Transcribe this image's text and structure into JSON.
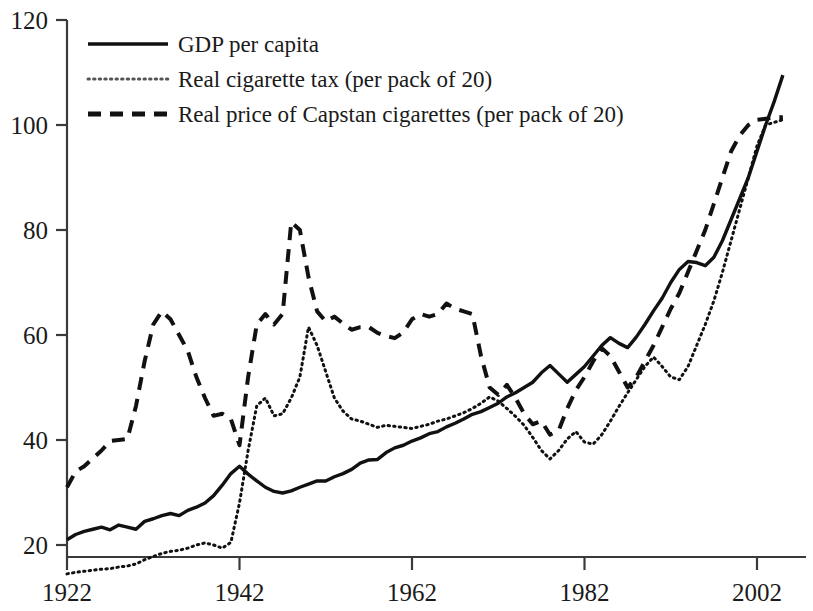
{
  "chart_data": {
    "type": "line",
    "title": "",
    "subtitle": "",
    "xlabel": "",
    "ylabel": "",
    "xlim": [
      1922,
      2006
    ],
    "ylim": [
      10,
      120
    ],
    "grid": false,
    "legend_position": "top-left",
    "x_ticks": [
      1922,
      1942,
      1962,
      1982,
      2002
    ],
    "x_tick_labels": [
      "1922",
      "1942",
      "1962",
      "1982",
      "2002"
    ],
    "y_ticks": [
      20,
      40,
      60,
      80,
      100,
      120
    ],
    "y_tick_labels": [
      "20",
      "40",
      "60",
      "80",
      "100",
      "120"
    ],
    "series": [
      {
        "name": "GDP per capita",
        "style": "solid",
        "color": "#111111",
        "x": [
          1922,
          1923,
          1924,
          1925,
          1926,
          1927,
          1928,
          1929,
          1930,
          1931,
          1932,
          1933,
          1934,
          1935,
          1936,
          1937,
          1938,
          1939,
          1940,
          1941,
          1942,
          1943,
          1944,
          1945,
          1946,
          1947,
          1948,
          1949,
          1950,
          1951,
          1952,
          1953,
          1954,
          1955,
          1956,
          1957,
          1958,
          1959,
          1960,
          1961,
          1962,
          1963,
          1964,
          1965,
          1966,
          1967,
          1968,
          1969,
          1970,
          1971,
          1972,
          1973,
          1974,
          1975,
          1976,
          1977,
          1978,
          1979,
          1980,
          1981,
          1982,
          1983,
          1984,
          1985,
          1986,
          1987,
          1988,
          1989,
          1990,
          1991,
          1992,
          1993,
          1994,
          1995,
          1996,
          1997,
          1998,
          1999,
          2000,
          2001,
          2002,
          2003,
          2004,
          2005
        ],
        "values": [
          21.0,
          22.0,
          22.6,
          23.0,
          23.4,
          22.9,
          23.8,
          23.4,
          23.0,
          24.5,
          25.0,
          25.6,
          26.0,
          25.6,
          26.6,
          27.2,
          28.0,
          29.4,
          31.4,
          33.6,
          35.0,
          33.5,
          32.2,
          31.0,
          30.2,
          29.9,
          30.3,
          31.0,
          31.6,
          32.2,
          32.2,
          33.0,
          33.6,
          34.4,
          35.6,
          36.2,
          36.3,
          37.6,
          38.5,
          39.0,
          39.8,
          40.4,
          41.2,
          41.6,
          42.5,
          43.2,
          44.0,
          44.9,
          45.4,
          46.2,
          47.0,
          48.2,
          49.0,
          50.0,
          51.0,
          52.8,
          54.2,
          52.6,
          51.0,
          52.5,
          54.0,
          56.0,
          58.0,
          59.5,
          58.4,
          57.6,
          59.6,
          62.0,
          64.6,
          67.0,
          70.0,
          72.5,
          74.0,
          73.8,
          73.2,
          74.8,
          78.0,
          82.0,
          86.0,
          90.0,
          95.0,
          100.0,
          104.5,
          109.5
        ]
      },
      {
        "name": "Real cigarette tax (per pack of 20)",
        "style": "dotted",
        "color": "#555555",
        "x": [
          1922,
          1923,
          1924,
          1925,
          1926,
          1927,
          1928,
          1929,
          1930,
          1931,
          1932,
          1933,
          1934,
          1935,
          1936,
          1937,
          1938,
          1939,
          1940,
          1941,
          1942,
          1943,
          1944,
          1945,
          1946,
          1947,
          1948,
          1949,
          1950,
          1951,
          1952,
          1953,
          1954,
          1955,
          1956,
          1957,
          1958,
          1959,
          1960,
          1961,
          1962,
          1963,
          1964,
          1965,
          1966,
          1967,
          1968,
          1969,
          1970,
          1971,
          1972,
          1973,
          1974,
          1975,
          1976,
          1977,
          1978,
          1979,
          1980,
          1981,
          1982,
          1983,
          1984,
          1985,
          1986,
          1987,
          1988,
          1989,
          1990,
          1991,
          1992,
          1993,
          1994,
          1995,
          1996,
          1997,
          1998,
          1999,
          2000,
          2001,
          2002,
          2003,
          2004,
          2005
        ],
        "values": [
          14.5,
          14.8,
          15.0,
          15.2,
          15.4,
          15.5,
          15.8,
          16.0,
          16.4,
          17.2,
          17.8,
          18.4,
          18.8,
          19.0,
          19.4,
          20.0,
          20.4,
          20.0,
          19.4,
          20.5,
          28.0,
          38.0,
          46.5,
          48.0,
          44.6,
          45.0,
          48.0,
          52.0,
          61.5,
          58.0,
          53.0,
          48.0,
          45.5,
          44.0,
          43.6,
          43.0,
          42.4,
          42.8,
          42.6,
          42.4,
          42.2,
          42.6,
          43.0,
          43.6,
          44.0,
          44.6,
          45.2,
          46.0,
          47.0,
          48.2,
          47.4,
          46.0,
          44.5,
          42.8,
          40.5,
          38.0,
          36.4,
          38.0,
          40.2,
          41.6,
          39.6,
          39.2,
          41.0,
          43.6,
          46.4,
          49.0,
          51.5,
          54.0,
          55.8,
          54.0,
          52.0,
          51.5,
          54.0,
          58.0,
          62.0,
          66.5,
          72.0,
          78.0,
          84.0,
          90.0,
          96.0,
          100.0,
          100.5,
          101.0
        ]
      },
      {
        "name": "Real price of Capstan cigarettes (per pack of 20)",
        "style": "dashed",
        "color": "#111111",
        "x": [
          1922,
          1923,
          1924,
          1925,
          1926,
          1927,
          1928,
          1929,
          1930,
          1931,
          1932,
          1933,
          1934,
          1935,
          1936,
          1937,
          1938,
          1939,
          1940,
          1941,
          1942,
          1943,
          1944,
          1945,
          1946,
          1947,
          1948,
          1949,
          1950,
          1951,
          1952,
          1953,
          1954,
          1955,
          1956,
          1957,
          1958,
          1959,
          1960,
          1961,
          1962,
          1963,
          1964,
          1965,
          1966,
          1967,
          1968,
          1969,
          1970,
          1971,
          1972,
          1973,
          1974,
          1975,
          1976,
          1977,
          1978,
          1979,
          1980,
          1981,
          1982,
          1983,
          1984,
          1985,
          1986,
          1987,
          1988,
          1989,
          1990,
          1991,
          1992,
          1993,
          1994,
          1995,
          1996,
          1997,
          1998,
          1999,
          2000,
          2001,
          2002,
          2003,
          2004,
          2005
        ],
        "values": [
          31.0,
          34.0,
          35.0,
          36.5,
          38.0,
          39.8,
          40.0,
          40.2,
          46.5,
          55.0,
          62.0,
          64.5,
          63.0,
          60.0,
          57.0,
          52.0,
          48.0,
          44.6,
          45.0,
          44.0,
          39.0,
          52.0,
          62.0,
          64.0,
          62.0,
          64.0,
          81.5,
          80.0,
          71.0,
          64.5,
          62.6,
          63.5,
          62.2,
          61.0,
          61.5,
          61.5,
          60.4,
          59.8,
          59.4,
          60.5,
          63.0,
          64.0,
          63.5,
          64.0,
          66.0,
          65.0,
          64.5,
          64.0,
          56.0,
          50.0,
          48.6,
          50.5,
          48.0,
          45.0,
          43.0,
          43.6,
          41.0,
          41.8,
          46.0,
          49.5,
          52.0,
          55.0,
          57.5,
          56.0,
          53.0,
          50.0,
          52.0,
          55.0,
          58.0,
          61.5,
          65.0,
          68.0,
          72.0,
          76.0,
          80.0,
          85.0,
          90.0,
          95.0,
          98.0,
          100.0,
          101.0,
          101.2,
          101.4,
          101.5
        ]
      }
    ]
  },
  "legend": {
    "items": [
      {
        "label": "GDP per capita",
        "style": "solid"
      },
      {
        "label": "Real cigarette tax (per pack of 20)",
        "style": "dotted"
      },
      {
        "label": "Real price of Capstan cigarettes (per pack of 20)",
        "style": "dashed"
      }
    ]
  }
}
